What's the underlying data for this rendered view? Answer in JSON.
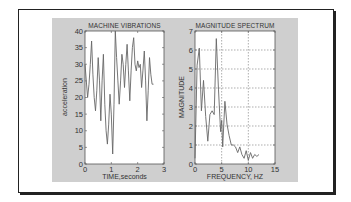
{
  "chart_data": [
    {
      "type": "line",
      "title": "MACHINE VIBRATIONS",
      "xlabel": "TIME,seconds",
      "ylabel": "acceleration",
      "xlim": [
        0,
        3
      ],
      "ylim": [
        0,
        40
      ],
      "xticks": [
        "0",
        "1",
        "2",
        "3"
      ],
      "yticks": [
        "0",
        "5",
        "10",
        "15",
        "20",
        "25",
        "30",
        "35",
        "40"
      ],
      "grid": false,
      "series": [
        {
          "name": "acceleration",
          "x": [
            0,
            0.05,
            0.1,
            0.15,
            0.2,
            0.25,
            0.3,
            0.35,
            0.4,
            0.45,
            0.5,
            0.55,
            0.6,
            0.65,
            0.7,
            0.75,
            0.8,
            0.85,
            0.9,
            0.95,
            1.0,
            1.05,
            1.1,
            1.15,
            1.2,
            1.25,
            1.3,
            1.35,
            1.4,
            1.45,
            1.5,
            1.55,
            1.6,
            1.65,
            1.7,
            1.75,
            1.8,
            1.85,
            1.9,
            1.95,
            2.0,
            2.05,
            2.1,
            2.15,
            2.2,
            2.25,
            2.3,
            2.35,
            2.4,
            2.45,
            2.5,
            2.55,
            2.6
          ],
          "values": [
            30,
            25,
            20,
            24,
            30,
            37,
            27,
            20,
            16,
            22,
            32,
            25,
            13,
            25,
            33,
            18,
            10,
            6,
            12,
            21,
            15,
            3,
            18,
            40,
            32,
            25,
            18,
            25,
            33,
            30,
            23,
            30,
            36,
            28,
            19,
            28,
            35,
            38,
            30,
            28,
            31,
            29,
            30,
            23,
            28,
            34,
            25,
            13,
            22,
            32,
            27,
            24,
            24
          ]
        }
      ]
    },
    {
      "type": "line",
      "title": "MAGNITUDE SPECTRUM",
      "xlabel": "FREQUENCY, HZ",
      "ylabel": "MAGNITUDE",
      "xlim": [
        0,
        15
      ],
      "ylim": [
        0,
        7
      ],
      "xticks": [
        "0",
        "5",
        "10",
        "15"
      ],
      "yticks": [
        "0",
        "1",
        "2",
        "3",
        "4",
        "5",
        "6",
        "7"
      ],
      "grid": true,
      "series": [
        {
          "name": "magnitude",
          "x": [
            0,
            0.4,
            0.8,
            1.2,
            1.6,
            2.0,
            2.4,
            2.8,
            3.2,
            3.6,
            4.0,
            4.4,
            4.8,
            5.0,
            5.2,
            5.6,
            6.0,
            6.4,
            6.8,
            7.2,
            7.6,
            8.0,
            8.4,
            8.8,
            9.2,
            9.6,
            10.0,
            10.4,
            10.8,
            11.2,
            11.6,
            12.0
          ],
          "values": [
            0.3,
            5.2,
            6.1,
            2.8,
            4.4,
            2.5,
            1.2,
            2.6,
            2.8,
            2.6,
            6.6,
            3.9,
            1.7,
            2.3,
            0.9,
            3.3,
            2.1,
            1.5,
            1.0,
            1.0,
            0.9,
            0.6,
            0.9,
            0.5,
            0.3,
            0.7,
            0.2,
            0.6,
            0.3,
            0.5,
            0.4,
            0.5
          ]
        }
      ]
    }
  ]
}
